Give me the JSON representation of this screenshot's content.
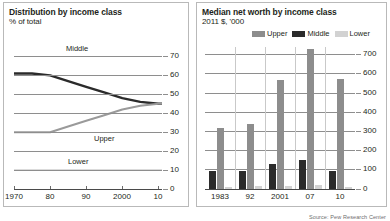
{
  "source_note": "Source: Pew Research Center",
  "left_panel": {
    "title": "Distribution by income class",
    "subtitle": "% of total",
    "label_middle": "Middle",
    "label_upper": "Upper",
    "label_lower": "Lower"
  },
  "right_panel": {
    "title": "Median net worth by income class",
    "subtitle": "2011 $, '000",
    "legend": [
      {
        "name": "Upper",
        "color": "#8d8d8d"
      },
      {
        "name": "Middle",
        "color": "#2b2b2b"
      },
      {
        "name": "Lower",
        "color": "#d2d2d2"
      }
    ]
  },
  "colors": {
    "middle_line": "#2b2b2b",
    "upper_line": "#9a9a9a",
    "lower_line": "#cfcfcf",
    "upper_bar": "#8d8d8d",
    "middle_bar": "#2b2b2b",
    "lower_bar": "#d2d2d2",
    "grid": "#8e8e8e",
    "panel_border": "#b9b9b9"
  },
  "chart_data": [
    {
      "type": "line",
      "title": "Distribution by income class",
      "subtitle": "% of total",
      "xlabel": "",
      "ylabel": "% of total",
      "ylim": [
        0,
        75
      ],
      "yticks": [
        0,
        10,
        20,
        30,
        40,
        50,
        60,
        70
      ],
      "xlim": [
        1970,
        2011
      ],
      "xticks": [
        1970,
        1980,
        1990,
        2000,
        2010
      ],
      "xticklabels": [
        "1970",
        "80",
        "90",
        "2000",
        "10"
      ],
      "grid": true,
      "legend": "inline-labels",
      "series": [
        {
          "name": "Middle",
          "color": "#2b2b2b",
          "x": [
            1970,
            1975,
            1980,
            1985,
            1990,
            1995,
            2000,
            2005,
            2010,
            2011
          ],
          "values": [
            61,
            61,
            60,
            57,
            54,
            51,
            48,
            46,
            45,
            45
          ]
        },
        {
          "name": "Upper",
          "color": "#9a9a9a",
          "x": [
            1970,
            1975,
            1980,
            1985,
            1990,
            1995,
            2000,
            2005,
            2010,
            2011
          ],
          "values": [
            30,
            30,
            30,
            33,
            36,
            39,
            42,
            44,
            45,
            45
          ]
        },
        {
          "name": "Lower",
          "color": "#cfcfcf",
          "x": [
            1970,
            1975,
            1980,
            1985,
            1990,
            1995,
            2000,
            2005,
            2010,
            2011
          ],
          "values": [
            10,
            10,
            10,
            10,
            10,
            10,
            10,
            10,
            10,
            10
          ]
        }
      ]
    },
    {
      "type": "bar",
      "title": "Median net worth by income class",
      "subtitle": "2011 $, '000",
      "xlabel": "",
      "ylabel": "2011 $, '000",
      "ylim": [
        0,
        740
      ],
      "yticks": [
        0,
        100,
        200,
        300,
        400,
        500,
        600,
        700
      ],
      "categories": [
        "1983",
        "92",
        "2001",
        "07",
        "10"
      ],
      "grid": true,
      "legend_position": "top",
      "series": [
        {
          "name": "Upper",
          "color": "#8d8d8d",
          "values": [
            318,
            338,
            569,
            729,
            574
          ]
        },
        {
          "name": "Middle",
          "color": "#2b2b2b",
          "values": [
            95,
            96,
            130,
            152,
            93
          ]
        },
        {
          "name": "Lower",
          "color": "#d2d2d2",
          "values": [
            11,
            14,
            18,
            19,
            9
          ]
        }
      ]
    }
  ]
}
